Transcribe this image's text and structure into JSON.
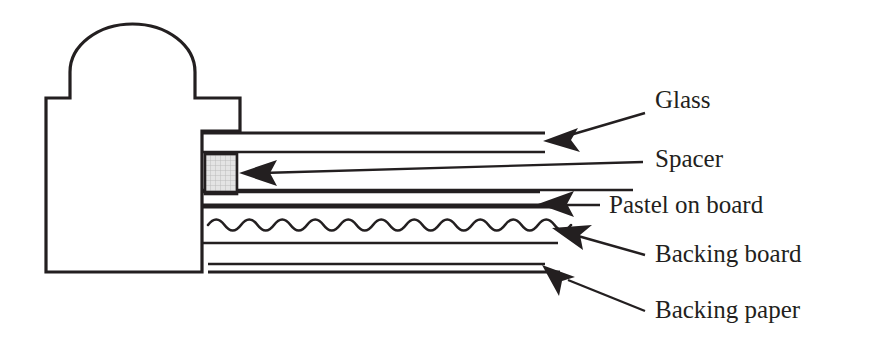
{
  "diagram": {
    "background_color": "#ffffff",
    "ink_color": "#231f20",
    "spacer_fill_color": "#e2e2e2",
    "width": 887,
    "height": 360
  },
  "labels": {
    "glass": "Glass",
    "spacer": "Spacer",
    "pastel_on_board": "Pastel on board",
    "backing_board": "Backing board",
    "backing_paper": "Backing paper"
  },
  "callouts": [
    {
      "id": "glass",
      "label": "Glass",
      "text_x": 655,
      "text_y": 108,
      "arrow_tip_x": 543,
      "arrow_tip_y": 140
    },
    {
      "id": "spacer",
      "label": "Spacer",
      "text_x": 655,
      "text_y": 167,
      "arrow_tip_x": 239,
      "arrow_tip_y": 173
    },
    {
      "id": "pastel-on-board",
      "label": "Pastel on board",
      "text_x": 609,
      "text_y": 213,
      "arrow_tip_x": 538,
      "arrow_tip_y": 203
    },
    {
      "id": "backing-board",
      "label": "Backing board",
      "text_x": 655,
      "text_y": 262,
      "arrow_tip_x": 552,
      "arrow_tip_y": 227
    },
    {
      "id": "backing-paper",
      "label": "Backing paper",
      "text_x": 655,
      "text_y": 318,
      "arrow_tip_x": 542,
      "arrow_tip_y": 265
    }
  ],
  "layers": [
    {
      "id": "glass",
      "name": "Glass",
      "y_top": 133,
      "y_bottom": 152,
      "x_start": 202,
      "x_end": 545
    },
    {
      "id": "air-gap",
      "name": "Air gap",
      "y_top": 152,
      "y_bottom": 190,
      "x_start": 202,
      "x_end": 633
    },
    {
      "id": "pastel",
      "name": "Pastel on board",
      "y_top": 190,
      "y_bottom": 207,
      "x_start": 202,
      "x_end": 540
    },
    {
      "id": "backing-board",
      "name": "Backing board",
      "y_top": 207,
      "y_bottom": 243,
      "x_start": 202,
      "x_end": 558
    },
    {
      "id": "backing-paper",
      "name": "Backing paper",
      "y_top": 262,
      "y_bottom": 272,
      "x_start": 202,
      "x_end": 545
    }
  ],
  "spacer_block": {
    "name": "Spacer",
    "x": 205,
    "y": 154,
    "width": 32,
    "height": 40
  },
  "corrugation": {
    "name": "Corrugated backing board fluting",
    "x_start": 208,
    "x_end": 560,
    "center_y": 225,
    "amplitude": 11,
    "period": 33,
    "cycles": 11
  },
  "frame_profile": {
    "name": "Frame moulding cross-section",
    "dome_left_x": 70,
    "dome_right_x": 195,
    "dome_apex_y": 24,
    "dome_base_y": 98,
    "body_left_x": 46,
    "body_bottom_y": 272,
    "notch_x": 70,
    "notch_y": 98,
    "step_right_x": 240,
    "rabbet_x": 202,
    "rabbet_y": 131
  }
}
